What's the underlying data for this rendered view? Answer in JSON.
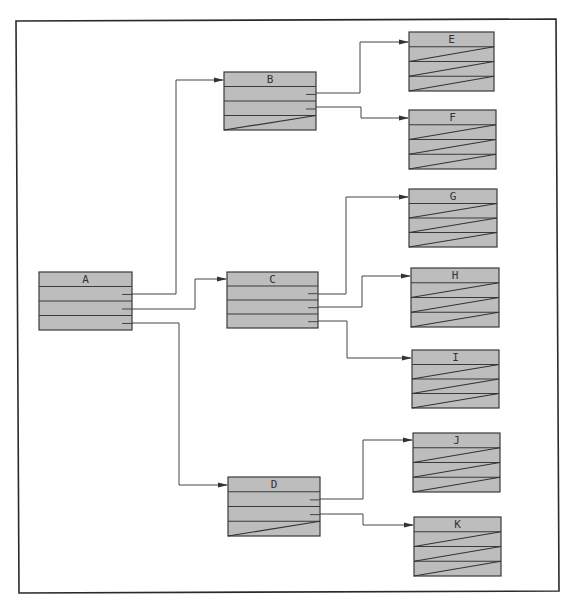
{
  "diagram": {
    "colors": {
      "box_fill": "#bdbdbd",
      "stroke": "#3a3a3a",
      "background": "#ffffff"
    },
    "nodes": [
      {
        "id": "A",
        "label": "A",
        "x": 39,
        "y": 272,
        "w": 93,
        "h": 58,
        "rows": 4,
        "ticks": [
          1,
          2,
          3
        ],
        "diag_rows": []
      },
      {
        "id": "B",
        "label": "B",
        "x": 224,
        "y": 72,
        "w": 92,
        "h": 58,
        "rows": 4,
        "ticks": [
          1,
          2
        ],
        "diag_rows": [
          3
        ]
      },
      {
        "id": "C",
        "label": "C",
        "x": 227,
        "y": 272,
        "w": 91,
        "h": 56,
        "rows": 4,
        "ticks": [
          1,
          2,
          3
        ],
        "diag_rows": []
      },
      {
        "id": "D",
        "label": "D",
        "x": 228,
        "y": 477,
        "w": 92,
        "h": 59,
        "rows": 4,
        "ticks": [
          1,
          2
        ],
        "diag_rows": [
          3
        ]
      },
      {
        "id": "E",
        "label": "E",
        "x": 409,
        "y": 32,
        "w": 85,
        "h": 59,
        "rows": 4,
        "ticks": [],
        "diag_rows": [
          1,
          2,
          3
        ]
      },
      {
        "id": "F",
        "label": "F",
        "x": 409,
        "y": 110,
        "w": 87,
        "h": 59,
        "rows": 4,
        "ticks": [],
        "diag_rows": [
          1,
          2,
          3
        ]
      },
      {
        "id": "G",
        "label": "G",
        "x": 409,
        "y": 189,
        "w": 88,
        "h": 58,
        "rows": 4,
        "ticks": [],
        "diag_rows": [
          1,
          2,
          3
        ]
      },
      {
        "id": "H",
        "label": "H",
        "x": 411,
        "y": 268,
        "w": 88,
        "h": 59,
        "rows": 4,
        "ticks": [],
        "diag_rows": [
          1,
          2,
          3
        ]
      },
      {
        "id": "I",
        "label": "I",
        "x": 412,
        "y": 350,
        "w": 87,
        "h": 58,
        "rows": 4,
        "ticks": [],
        "diag_rows": [
          1,
          2,
          3
        ]
      },
      {
        "id": "J",
        "label": "J",
        "x": 413,
        "y": 433,
        "w": 87,
        "h": 59,
        "rows": 4,
        "ticks": [],
        "diag_rows": [
          1,
          2,
          3
        ]
      },
      {
        "id": "K",
        "label": "K",
        "x": 414,
        "y": 517,
        "w": 87,
        "h": 59,
        "rows": 4,
        "ticks": [],
        "diag_rows": [
          1,
          2,
          3
        ]
      }
    ],
    "edges": [
      {
        "from": "A",
        "to": "B",
        "points": [
          [
            122,
            294
          ],
          [
            176,
            294
          ],
          [
            176,
            80
          ],
          [
            224,
            80
          ]
        ]
      },
      {
        "from": "A",
        "to": "C",
        "points": [
          [
            122,
            309
          ],
          [
            195,
            309
          ],
          [
            195,
            279
          ],
          [
            227,
            279
          ]
        ]
      },
      {
        "from": "A",
        "to": "D",
        "points": [
          [
            122,
            323
          ],
          [
            179,
            323
          ],
          [
            179,
            485
          ],
          [
            228,
            485
          ]
        ]
      },
      {
        "from": "B",
        "to": "E",
        "points": [
          [
            306,
            93
          ],
          [
            360,
            93
          ],
          [
            360,
            42
          ],
          [
            409,
            42
          ]
        ]
      },
      {
        "from": "B",
        "to": "F",
        "points": [
          [
            306,
            107
          ],
          [
            361,
            107
          ],
          [
            361,
            118
          ],
          [
            409,
            118
          ]
        ]
      },
      {
        "from": "C",
        "to": "G",
        "points": [
          [
            308,
            294
          ],
          [
            346,
            294
          ],
          [
            346,
            197
          ],
          [
            409,
            197
          ]
        ]
      },
      {
        "from": "C",
        "to": "H",
        "points": [
          [
            308,
            307
          ],
          [
            362,
            307
          ],
          [
            362,
            276
          ],
          [
            411,
            276
          ]
        ]
      },
      {
        "from": "C",
        "to": "I",
        "points": [
          [
            308,
            321
          ],
          [
            347,
            321
          ],
          [
            347,
            358
          ],
          [
            412,
            358
          ]
        ]
      },
      {
        "from": "D",
        "to": "J",
        "points": [
          [
            310,
            499
          ],
          [
            363,
            499
          ],
          [
            363,
            440
          ],
          [
            413,
            440
          ]
        ]
      },
      {
        "from": "D",
        "to": "K",
        "points": [
          [
            310,
            514
          ],
          [
            363,
            514
          ],
          [
            363,
            525
          ],
          [
            414,
            525
          ]
        ]
      }
    ]
  }
}
